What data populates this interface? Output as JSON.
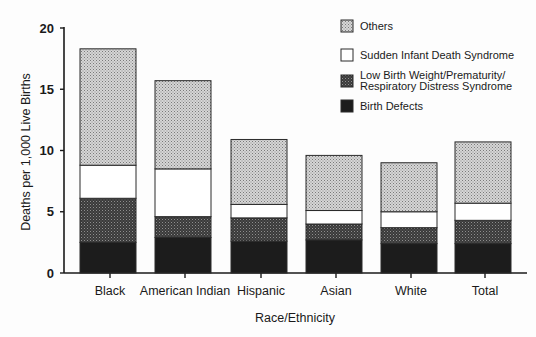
{
  "chart_data": {
    "type": "bar",
    "stacked": true,
    "title": "",
    "xlabel": "Race/Ethnicity",
    "ylabel": "Deaths per 1,000 Live Births",
    "ylim": [
      0,
      20
    ],
    "yticks": [
      0,
      5,
      10,
      15,
      20
    ],
    "grid": false,
    "legend_position": "top-right",
    "categories": [
      "Black",
      "American Indian",
      "Hispanic",
      "Asian",
      "White",
      "Total"
    ],
    "series": [
      {
        "name": "Birth Defects",
        "fill": "#1c1c1c",
        "pattern": "solid-dark",
        "values": [
          2.5,
          2.9,
          2.6,
          2.7,
          2.4,
          2.4
        ]
      },
      {
        "name": "Low Birth Weight/Prematurity/ Respiratory Distress Syndrome",
        "fill": "#4a4a4a",
        "pattern": "dark-stipple",
        "values": [
          3.6,
          1.7,
          1.9,
          1.3,
          1.3,
          1.9
        ]
      },
      {
        "name": "Sudden Infant Death Syndrome",
        "fill": "#ffffff",
        "pattern": "none",
        "values": [
          2.7,
          3.9,
          1.1,
          1.1,
          1.3,
          1.4
        ]
      },
      {
        "name": "Others",
        "fill": "#bdbdbd",
        "pattern": "light-stipple",
        "values": [
          9.5,
          7.2,
          5.3,
          4.5,
          4.0,
          5.0
        ]
      }
    ],
    "totals": [
      18.3,
      15.7,
      10.9,
      9.6,
      9.0,
      10.7
    ]
  },
  "legend": {
    "items": [
      {
        "label": "Others",
        "pattern": "light"
      },
      {
        "label": "Sudden Infant Death Syndrome",
        "pattern": "white"
      },
      {
        "label_lines": [
          "Low Birth Weight/Prematurity/",
          "Respiratory Distress Syndrome"
        ],
        "pattern": "dark"
      },
      {
        "label": "Birth Defects",
        "pattern": "black"
      }
    ]
  }
}
